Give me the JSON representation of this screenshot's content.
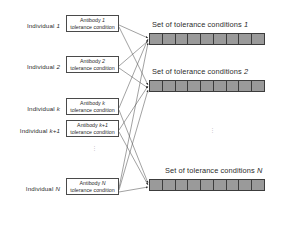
{
  "figure": {
    "individuals": [
      {
        "label_prefix": "Individual",
        "label_index": "1",
        "box_line1_prefix": "Antibody",
        "box_line1_index": "1",
        "box_line2": "tolerance condition"
      },
      {
        "label_prefix": "Individual",
        "label_index": "2",
        "box_line1_prefix": "Antibody",
        "box_line1_index": "2",
        "box_line2": "tolerance condition"
      },
      {
        "label_prefix": "Individual",
        "label_index": "k",
        "box_line1_prefix": "Antibody",
        "box_line1_index": "k",
        "box_line2": "tolerance condition"
      },
      {
        "label_prefix": "Individual",
        "label_index": "k+1",
        "box_line1_prefix": "Antibody",
        "box_line1_index": "k+1",
        "box_line2": "tolerance condition"
      },
      {
        "label_prefix": "Individual",
        "label_index": "N",
        "box_line1_prefix": "Antibody",
        "box_line1_index": "N",
        "box_line2": "tolerance condition"
      }
    ],
    "sets": [
      {
        "title": "Set of tolerance conditions",
        "index": "1",
        "cells": 9
      },
      {
        "title": "Set of tolerance conditions",
        "index": "2",
        "cells": 9
      },
      {
        "title": "Set of tolerance conditions",
        "index": "N",
        "cells": 9
      }
    ],
    "ellipsis_marker": "⋮",
    "colors": {
      "bar_fill": "#9a9a9a",
      "bar_border": "#3c3c3c",
      "box_border": "#4a4a4a",
      "text": "#2b2b2b",
      "line": "#555555",
      "background": "#ffffff"
    }
  }
}
